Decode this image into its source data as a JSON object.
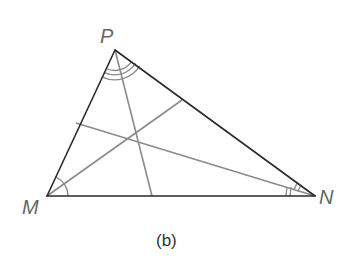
{
  "figure": {
    "caption": "(b)",
    "vertices": {
      "P": {
        "label": "P",
        "x": 115,
        "y": 50
      },
      "M": {
        "label": "M",
        "x": 47,
        "y": 196
      },
      "N": {
        "label": "N",
        "x": 315,
        "y": 196
      }
    },
    "bisectors": [
      {
        "from": "P",
        "to_side": "MN",
        "end": {
          "x": 152,
          "y": 196
        }
      },
      {
        "from": "M",
        "to_side": "PN",
        "end": {
          "x": 182,
          "y": 100
        }
      },
      {
        "from": "N",
        "to_side": "PM",
        "end": {
          "x": 76,
          "y": 123
        }
      }
    ],
    "incenter": {
      "x": 133,
      "y": 138
    },
    "angle_marks": {
      "P": {
        "arcs": 3
      },
      "M": {
        "arcs": 1
      },
      "N": {
        "ticks": 2
      }
    },
    "colors": {
      "sides": "#2a2a2a",
      "bisectors": "#8a8a8a",
      "labels": "#666666",
      "caption": "#333333"
    }
  }
}
